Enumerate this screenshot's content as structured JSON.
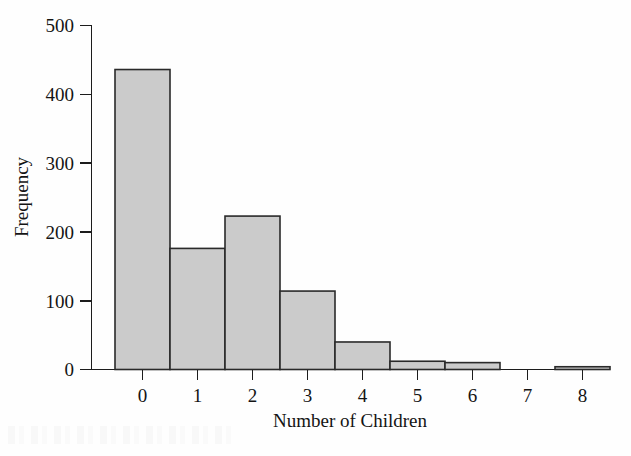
{
  "chart_data": {
    "type": "bar",
    "title": "",
    "subtitle": "",
    "xlabel": "Number of Children",
    "ylabel": "Frequency",
    "categories": [
      "0",
      "1",
      "2",
      "3",
      "4",
      "5",
      "6",
      "7",
      "8"
    ],
    "values": [
      436,
      176,
      223,
      114,
      40,
      12,
      10,
      0,
      4
    ],
    "x": [
      0,
      1,
      2,
      3,
      4,
      5,
      6,
      7,
      8
    ],
    "xlim": [
      -0.5,
      8.5
    ],
    "ylim": [
      0,
      500
    ],
    "y_ticks": [
      0,
      100,
      200,
      300,
      400,
      500
    ],
    "y_tick_labels": [
      "0",
      "100",
      "200",
      "300",
      "400",
      "500"
    ],
    "x_ticks": [
      0,
      1,
      2,
      3,
      4,
      5,
      6,
      7,
      8
    ],
    "x_tick_labels": [
      "0",
      "1",
      "2",
      "3",
      "4",
      "5",
      "6",
      "7",
      "8"
    ],
    "grid": false,
    "legend": false,
    "legend_position": "none",
    "bar_width": 1.0,
    "bar_fill_color": "#cbcbcb",
    "bar_edge_color": "#2a2a2a",
    "axis_color": "#1c1c1c",
    "background_color": "#fefefe"
  },
  "figure": {
    "y_axis_label": "Frequency",
    "x_axis_label": "Number of Children"
  }
}
